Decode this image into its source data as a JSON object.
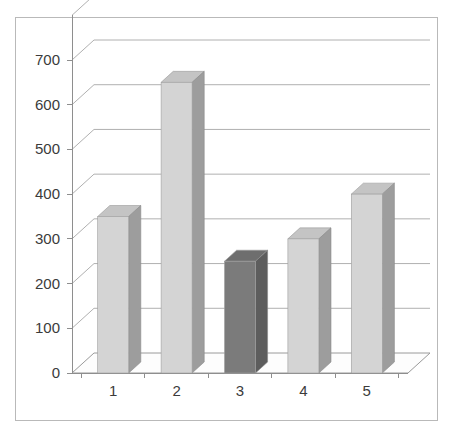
{
  "chart_data": {
    "type": "bar",
    "title": "",
    "subtitle": "",
    "xlabel": "",
    "ylabel": "",
    "categories": [
      "1",
      "2",
      "3",
      "4",
      "5"
    ],
    "values": [
      350,
      650,
      250,
      300,
      400
    ],
    "ylim": [
      0,
      800
    ],
    "y_ticks": [
      "0",
      "100",
      "200",
      "300",
      "400",
      "500",
      "600",
      "700"
    ],
    "y_tick_values": [
      0,
      100,
      200,
      300,
      400,
      500,
      600,
      700
    ],
    "grid": true,
    "legend": "none",
    "style": "3d-column",
    "highlighted_index": 2,
    "colors": {
      "bar_front": "#d4d4d4",
      "bar_side": "#9d9d9d",
      "bar_top": "#c4c4c4",
      "highlight_front": "#7b7b7b",
      "highlight_side": "#5d5d5d",
      "highlight_top": "#6e6e6e",
      "gridline": "#b0b0b0",
      "axis": "#8e8e8e",
      "border": "#b9b9b9",
      "text": "#3b3b3b",
      "background": "#ffffff"
    },
    "series": [
      {
        "name": "Series 1",
        "values": [
          350,
          650,
          250,
          300,
          400
        ]
      }
    ],
    "points": [
      {
        "category": "1",
        "value": 350,
        "highlighted": false
      },
      {
        "category": "2",
        "value": 650,
        "highlighted": false
      },
      {
        "category": "3",
        "value": 250,
        "highlighted": true
      },
      {
        "category": "4",
        "value": 300,
        "highlighted": false
      },
      {
        "category": "5",
        "value": 400,
        "highlighted": false
      }
    ]
  }
}
